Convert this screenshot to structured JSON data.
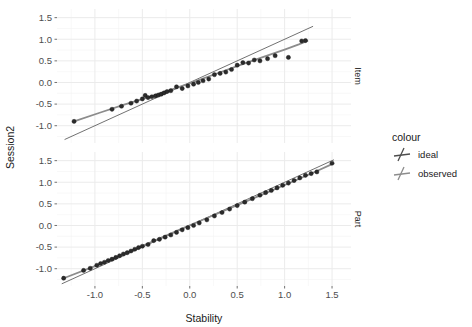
{
  "chart_data": {
    "type": "scatter",
    "title": "",
    "xlabel": "Stability",
    "ylabel": "Session2",
    "legend_title": "colour",
    "legend_position": "right",
    "grid": true,
    "xlim": [
      -1.4,
      1.7
    ],
    "ylim": [
      -1.4,
      1.7
    ],
    "xticks": [
      -1.0,
      -0.5,
      0.0,
      0.5,
      1.0,
      1.5
    ],
    "xticklabels": [
      "-1.0",
      "-0.5",
      "0.0",
      "0.5",
      "1.0",
      "1.5"
    ],
    "yticks": [
      -1.0,
      -0.5,
      0.0,
      0.5,
      1.0,
      1.5
    ],
    "yticklabels": [
      "-1.0",
      "-0.5",
      "0.0",
      "0.5",
      "1.0",
      "1.5"
    ],
    "legend_entries": [
      {
        "name": "ideal",
        "colour": "#4d4d4d"
      },
      {
        "name": "observed",
        "colour": "#8c8c8c"
      }
    ],
    "facets": [
      {
        "strip_label": "Item",
        "ideal_line": {
          "name": "ideal",
          "colour": "#4d4d4d",
          "x": [
            -1.32,
            1.3
          ],
          "y": [
            -1.32,
            1.3
          ]
        },
        "observed_line": {
          "name": "observed",
          "colour": "#8c8c8c",
          "x": [
            -1.22,
            -0.95,
            -0.7,
            -0.45,
            -0.2,
            0.05,
            0.3,
            0.55,
            0.8,
            1.0,
            1.15,
            1.24
          ],
          "y": [
            -0.9,
            -0.7,
            -0.52,
            -0.35,
            -0.17,
            0.02,
            0.22,
            0.42,
            0.61,
            0.76,
            0.88,
            0.96
          ]
        },
        "points": {
          "x": [
            -1.22,
            -0.82,
            -0.72,
            -0.62,
            -0.56,
            -0.5,
            -0.47,
            -0.44,
            -0.4,
            -0.36,
            -0.33,
            -0.3,
            -0.27,
            -0.24,
            -0.2,
            -0.14,
            -0.08,
            -0.02,
            0.04,
            0.09,
            0.14,
            0.2,
            0.26,
            0.32,
            0.38,
            0.44,
            0.5,
            0.56,
            0.62,
            0.68,
            0.74,
            0.82,
            0.9,
            1.04,
            1.18,
            1.22
          ],
          "y": [
            -0.9,
            -0.62,
            -0.55,
            -0.48,
            -0.43,
            -0.38,
            -0.3,
            -0.35,
            -0.33,
            -0.31,
            -0.29,
            -0.27,
            -0.24,
            -0.21,
            -0.19,
            -0.1,
            -0.14,
            -0.08,
            -0.04,
            0.0,
            0.04,
            0.08,
            0.18,
            0.21,
            0.24,
            0.3,
            0.4,
            0.46,
            0.45,
            0.52,
            0.5,
            0.55,
            0.62,
            0.58,
            0.96,
            0.97
          ]
        }
      },
      {
        "strip_label": "Part",
        "ideal_line": {
          "name": "ideal",
          "colour": "#4d4d4d",
          "x": [
            -1.35,
            1.52
          ],
          "y": [
            -1.35,
            1.52
          ]
        },
        "observed_line": {
          "name": "observed",
          "colour": "#8c8c8c",
          "x": [
            -1.33,
            -1.0,
            -0.7,
            -0.4,
            -0.1,
            0.2,
            0.5,
            0.8,
            1.1,
            1.3,
            1.5
          ],
          "y": [
            -1.22,
            -0.94,
            -0.66,
            -0.38,
            -0.09,
            0.19,
            0.47,
            0.75,
            1.03,
            1.22,
            1.42
          ]
        },
        "points": {
          "x": [
            -1.33,
            -1.12,
            -1.05,
            -0.98,
            -0.94,
            -0.9,
            -0.86,
            -0.82,
            -0.78,
            -0.74,
            -0.7,
            -0.66,
            -0.62,
            -0.58,
            -0.54,
            -0.5,
            -0.44,
            -0.38,
            -0.32,
            -0.26,
            -0.2,
            -0.14,
            -0.08,
            -0.02,
            0.04,
            0.1,
            0.18,
            0.26,
            0.34,
            0.42,
            0.5,
            0.58,
            0.66,
            0.74,
            0.8,
            0.86,
            0.92,
            0.98,
            1.04,
            1.1,
            1.16,
            1.22,
            1.28,
            1.34,
            1.5
          ],
          "y": [
            -1.22,
            -1.04,
            -0.99,
            -0.92,
            -0.88,
            -0.85,
            -0.81,
            -0.78,
            -0.74,
            -0.7,
            -0.66,
            -0.63,
            -0.59,
            -0.55,
            -0.51,
            -0.48,
            -0.44,
            -0.35,
            -0.32,
            -0.27,
            -0.22,
            -0.16,
            -0.1,
            -0.05,
            0.0,
            0.06,
            0.13,
            0.22,
            0.3,
            0.38,
            0.46,
            0.54,
            0.62,
            0.7,
            0.76,
            0.81,
            0.87,
            0.93,
            0.98,
            1.04,
            1.1,
            1.16,
            1.2,
            1.24,
            1.44
          ]
        }
      }
    ]
  }
}
